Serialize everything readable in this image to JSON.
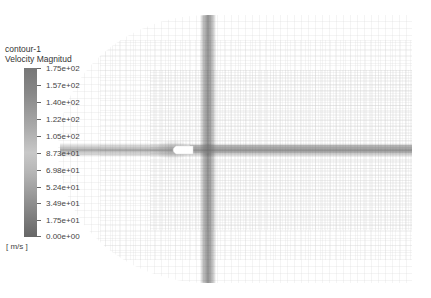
{
  "legend": {
    "title": "contour-1",
    "variable": "Velocity Magnitude",
    "variable_display": "Velocity Magnitud",
    "units": "[ m/s ]",
    "ticks": [
      "1.75e+02",
      "1.57e+02",
      "1.40e+02",
      "1.22e+02",
      "1.05e+02",
      "8.73e+01",
      "6.98e+01",
      "5.24e+01",
      "3.49e+01",
      "1.75e+01",
      "0.00e+00"
    ],
    "colormap": "grayscale",
    "range": [
      0,
      175
    ]
  },
  "scene": {
    "type": "CFD mesh contour plot",
    "background": "#ffffff",
    "mesh_color": "#bcbcbc",
    "refinement_bands": [
      "vertical band near x=208",
      "horizontal wake band along y=150"
    ],
    "body": "bullet-shaped object at center-left with downstream wake"
  }
}
